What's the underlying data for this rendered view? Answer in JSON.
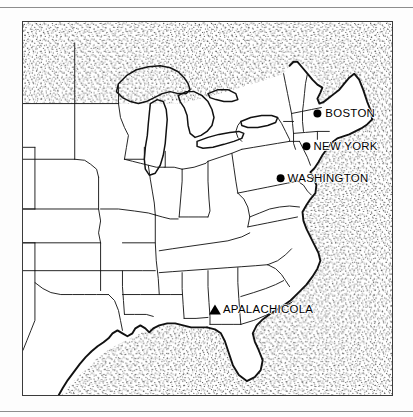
{
  "page": {
    "background_color": "#fdfdfd",
    "rule_color": "#8d8d8d",
    "ink_color": "#111111"
  },
  "map": {
    "title": "Eastern United States",
    "frame": {
      "x": 22,
      "y": 21,
      "width": 371,
      "height": 375
    },
    "style": "black-and-white line map with stippled water",
    "water_fill": "stipple",
    "land_fill": "#ffffff",
    "cities": [
      {
        "name": "BOSTON",
        "marker": "circle",
        "label_side": "right",
        "x": 318,
        "y": 113
      },
      {
        "name": "NEW YORK",
        "marker": "circle",
        "label_side": "right",
        "x": 307,
        "y": 148
      },
      {
        "name": "WASHINGTON",
        "marker": "circle",
        "label_side": "right",
        "x": 281,
        "y": 180
      },
      {
        "name": "APALACHICOLA",
        "marker": "triangle",
        "label_side": "right",
        "x": 215,
        "y": 308
      }
    ],
    "water_bodies": [
      "Atlantic Ocean",
      "Gulf of Mexico",
      "Lake Superior",
      "Lake Michigan",
      "Lake Huron",
      "Lake Erie",
      "Lake Ontario"
    ]
  }
}
